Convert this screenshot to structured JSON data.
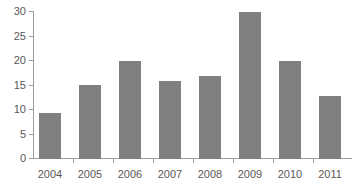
{
  "chart_data": {
    "type": "bar",
    "title": "",
    "subtitle": "",
    "xlabel": "",
    "ylabel": "",
    "categories": [
      "2004",
      "2005",
      "2006",
      "2007",
      "2008",
      "2009",
      "2010",
      "2011"
    ],
    "values": [
      9.2,
      15.0,
      20.0,
      15.8,
      16.9,
      30.0,
      19.9,
      12.7
    ],
    "series": [
      {
        "name": "",
        "values": [
          9.2,
          15.0,
          20.0,
          15.8,
          16.9,
          30.0,
          19.9,
          12.7
        ]
      }
    ],
    "ylim": [
      0,
      30
    ],
    "y_ticks": [
      0,
      5,
      10,
      15,
      20,
      25,
      30
    ],
    "y_tick_labels": [
      "0",
      "5",
      "10",
      "15",
      "20",
      "25",
      "30"
    ],
    "x_tick_labels": [
      "2004",
      "2005",
      "2006",
      "2007",
      "2008",
      "2009",
      "2010",
      "2011"
    ],
    "grid": false,
    "legend": false,
    "legend_position": "none",
    "bar_color": "#808080",
    "axis_color": "#9c9c9c",
    "tick_label_color": "#595959",
    "background_color": "#ffffff"
  }
}
